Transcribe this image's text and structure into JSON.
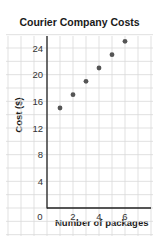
{
  "chart_data": {
    "type": "scatter",
    "title": "Courier Company Costs",
    "xlabel": "Number of packages",
    "ylabel": "Cost ($)",
    "x": [
      1,
      2,
      3,
      4,
      5,
      6
    ],
    "y": [
      15,
      17,
      19,
      21,
      23,
      25
    ],
    "series": [
      {
        "name": "Cost",
        "x": [
          1,
          2,
          3,
          4,
          5,
          6
        ],
        "y": [
          15,
          17,
          19,
          21,
          23,
          25
        ]
      }
    ],
    "xticks": [
      0,
      2,
      4,
      6
    ],
    "yticks": [
      0,
      4,
      8,
      12,
      16,
      20,
      24
    ],
    "xlim": [
      0,
      8
    ],
    "ylim": [
      0,
      26
    ],
    "grid": true,
    "legend": "none",
    "colors": {
      "point": "#555555",
      "grid": "#d9d9d9",
      "axis": "#222222",
      "text": "#333333"
    }
  }
}
